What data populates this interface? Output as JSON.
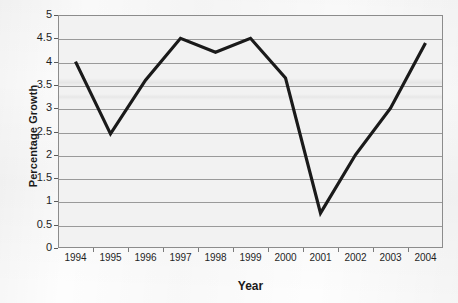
{
  "chart_data": {
    "type": "line",
    "title": "",
    "xlabel": "Year",
    "ylabel": "Percentage Growth",
    "categories": [
      "1994",
      "1995",
      "1996",
      "1997",
      "1998",
      "1999",
      "2000",
      "2001",
      "2002",
      "2003",
      "2004"
    ],
    "values": [
      4.0,
      2.45,
      3.6,
      4.5,
      4.2,
      4.5,
      3.65,
      0.75,
      2.0,
      3.0,
      4.4
    ],
    "series": [
      {
        "name": "Percentage Growth",
        "values": [
          4.0,
          2.45,
          3.6,
          4.5,
          4.2,
          4.5,
          3.65,
          0.75,
          2.0,
          3.0,
          4.4
        ]
      }
    ],
    "ylim": [
      0,
      5
    ],
    "ytick_labels": [
      "0",
      "0.5",
      "1",
      "1.5",
      "2",
      "2.5",
      "3",
      "3.5",
      "4",
      "4.5",
      "5"
    ],
    "ytick_values": [
      0,
      0.5,
      1,
      1.5,
      2,
      2.5,
      3,
      3.5,
      4,
      4.5,
      5
    ],
    "grid": true,
    "legend": "none",
    "line_color": "#1a1a1a",
    "plot_background": "#f2f2f2",
    "axis_color": "#8c8c8c",
    "gridline_color": "#9a9a9a"
  }
}
